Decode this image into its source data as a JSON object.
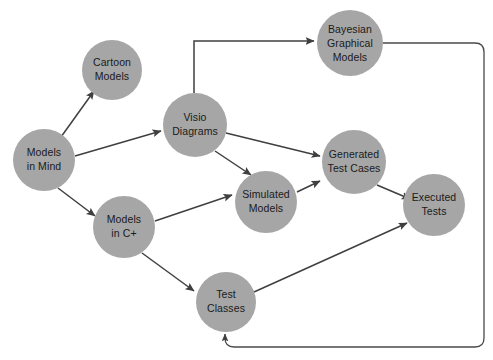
{
  "diagram": {
    "type": "directed-graph",
    "canvas": {
      "width": 493,
      "height": 360,
      "background": "#ffffff"
    },
    "style": {
      "node_fill": "#a6a6a6",
      "node_text_color": "#1a1a1a",
      "edge_color": "#3f3f3f"
    },
    "nodes": [
      {
        "id": "models-in-mind",
        "label_lines": [
          "Models",
          "in Mind"
        ],
        "line1": "Models",
        "line2": "in Mind",
        "cx": 44,
        "cy": 160,
        "r": 31
      },
      {
        "id": "cartoon-models",
        "label_lines": [
          "Cartoon",
          "Models"
        ],
        "line1": "Cartoon",
        "line2": "Models",
        "cx": 112,
        "cy": 70,
        "r": 30
      },
      {
        "id": "visio-diagrams",
        "label_lines": [
          "Visio",
          "Diagrams"
        ],
        "line1": "Visio",
        "line2": "Diagrams",
        "cx": 195,
        "cy": 125,
        "r": 32
      },
      {
        "id": "bayesian-graphical-models",
        "label_lines": [
          "Bayesian",
          "Graphical",
          "Models"
        ],
        "line1": "Bayesian",
        "line2": "Graphical",
        "line3": "Models",
        "cx": 350,
        "cy": 43,
        "r": 33
      },
      {
        "id": "models-in-c-plus",
        "label_lines": [
          "Models",
          "in C+"
        ],
        "line1": "Models",
        "line2": "in C+",
        "cx": 124,
        "cy": 227,
        "r": 31
      },
      {
        "id": "simulated-models",
        "label_lines": [
          "Simulated",
          "Models"
        ],
        "line1": "Simulated",
        "line2": "Models",
        "cx": 266,
        "cy": 202,
        "r": 31
      },
      {
        "id": "generated-test-cases",
        "label_lines": [
          "Generated",
          "Test Cases"
        ],
        "line1": "Generated",
        "line2": "Test Cases",
        "cx": 354,
        "cy": 162,
        "r": 32
      },
      {
        "id": "executed-tests",
        "label_lines": [
          "Executed",
          "Tests"
        ],
        "line1": "Executed",
        "line2": "Tests",
        "cx": 434,
        "cy": 205,
        "r": 31
      },
      {
        "id": "test-classes",
        "label_lines": [
          "Test",
          "Classes"
        ],
        "line1": "Test",
        "line2": "Classes",
        "cx": 226,
        "cy": 302,
        "r": 30
      }
    ],
    "edges": [
      {
        "id": "edge-mind-to-cartoon",
        "from": "models-in-mind",
        "to": "cartoon-models",
        "arrow": true
      },
      {
        "id": "edge-mind-to-visio",
        "from": "models-in-mind",
        "to": "visio-diagrams",
        "arrow": true
      },
      {
        "id": "edge-mind-to-cplus",
        "from": "models-in-mind",
        "to": "models-in-c-plus",
        "arrow": true
      },
      {
        "id": "edge-visio-to-bayesian",
        "from": "visio-diagrams",
        "to": "bayesian-graphical-models",
        "arrow": true,
        "routing": "orthogonal-up-right"
      },
      {
        "id": "edge-visio-to-generated",
        "from": "visio-diagrams",
        "to": "generated-test-cases",
        "arrow": true
      },
      {
        "id": "edge-visio-to-simulated",
        "from": "visio-diagrams",
        "to": "simulated-models",
        "arrow": true
      },
      {
        "id": "edge-cplus-to-simulated",
        "from": "models-in-c-plus",
        "to": "simulated-models",
        "arrow": true
      },
      {
        "id": "edge-cplus-to-testclasses",
        "from": "models-in-c-plus",
        "to": "test-classes",
        "arrow": true
      },
      {
        "id": "edge-simulated-to-generated",
        "from": "simulated-models",
        "to": "generated-test-cases",
        "arrow": true
      },
      {
        "id": "edge-generated-to-executed",
        "from": "generated-test-cases",
        "to": "executed-tests",
        "arrow": true
      },
      {
        "id": "edge-testclasses-to-executed",
        "from": "test-classes",
        "to": "executed-tests",
        "arrow": true
      },
      {
        "id": "edge-bayesian-to-testclasses",
        "from": "bayesian-graphical-models",
        "to": "test-classes",
        "arrow": true,
        "routing": "orthogonal-right-down-left-up"
      }
    ]
  }
}
